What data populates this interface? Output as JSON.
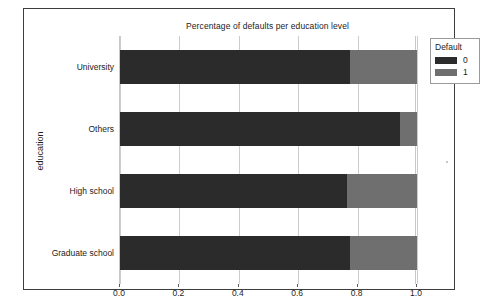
{
  "top_ghost_text": "",
  "figure": {
    "title": "Percentage of defaults per education level"
  },
  "legend": {
    "title": "Default",
    "items": [
      {
        "label": "0",
        "color": "#2b2b2b"
      },
      {
        "label": "1",
        "color": "#6f6f6f"
      }
    ]
  },
  "axes": {
    "y_title": "education",
    "y_ticks": [
      "University",
      "Others",
      "High school",
      "Graduate school"
    ],
    "x_ticks": [
      "0.0",
      "0.2",
      "0.4",
      "0.6",
      "0.8",
      "1.0"
    ]
  },
  "chart_data": {
    "type": "bar",
    "orientation": "horizontal",
    "stacked": true,
    "normalized": true,
    "title": "Percentage of defaults per education level",
    "xlabel": "",
    "ylabel": "education",
    "categories": [
      "University",
      "Others",
      "High school",
      "Graduate school"
    ],
    "series": [
      {
        "name": "0",
        "color": "#2b2b2b",
        "values": [
          0.774,
          0.943,
          0.764,
          0.774
        ]
      },
      {
        "name": "1",
        "color": "#6f6f6f",
        "values": [
          0.226,
          0.057,
          0.236,
          0.226
        ]
      }
    ],
    "xlim": [
      0.0,
      1.0
    ],
    "x_tick_values": [
      0.0,
      0.2,
      0.4,
      0.6,
      0.8,
      1.0
    ],
    "x_tick_labels": [
      "0.0",
      "0.2",
      "0.4",
      "0.6",
      "0.8",
      "1.0"
    ],
    "grid": true,
    "grid_axis": "x",
    "legend": {
      "title": "Default",
      "position": "upper right (outside)"
    }
  }
}
